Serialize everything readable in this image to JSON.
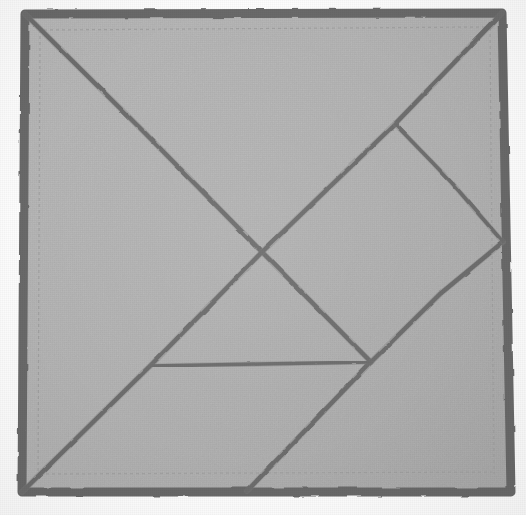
{
  "scene": {
    "title": "Tangram dissection square on cloth",
    "medium": "hand-drawn lines on gray fabric",
    "canvas": {
      "width": 526,
      "height": 515
    },
    "page_background": "#fefefe"
  },
  "colors": {
    "cloth_fill": "#b2b2b2",
    "cloth_fill_light": "#b8b8b8",
    "cloth_fill_dark": "#aaaaaa",
    "border_stroke": "#6b6b6b",
    "line_stroke": "#6e6e6e",
    "line_stroke_soft": "#7e7e7e",
    "hem_stitch": "#a2a2a2"
  },
  "strokes": {
    "border_width": 9,
    "line_width": 4.2,
    "line_width_thin": 3.2,
    "hem_width": 1.2
  },
  "cloth_outline": {
    "name": "square-cloth-outline",
    "points": "25,14 502,13 511,492 22,492"
  },
  "hem_stitching": [
    {
      "name": "hem-top",
      "points": "44,30 486,27"
    },
    {
      "name": "hem-bottom",
      "points": "40,474 492,472"
    },
    {
      "name": "hem-left",
      "points": "40,30 38,474"
    },
    {
      "name": "hem-right",
      "points": "490,28 494,474"
    }
  ],
  "dissection_lines": [
    {
      "id": "main-diagonal",
      "label": "Top-left corner to lower mid vertex",
      "points": "25,14 143,131 262,252 371,362",
      "width": 4.4
    },
    {
      "id": "anti-diagonal",
      "label": "Bottom-left corner to top-right corner",
      "points": "22,492 150,366 262,252 395,124 502,13",
      "width": 4.4
    },
    {
      "id": "bottom-diagonal",
      "label": "Bottom edge to right edge through mid vertex",
      "points": "247,491 371,362 440,294 503,242",
      "width": 4.4
    },
    {
      "id": "horizontal-chord",
      "label": "Horizontal chord between anti-diagonal and mid vertex",
      "points": "151,366 262,364 371,362",
      "width": 3.6
    },
    {
      "id": "upper-right-chord",
      "label": "Short chord from anti-diagonal down-right to right edge",
      "points": "395,124 430,160 452,183 477,212 503,242",
      "width": 3.6
    }
  ],
  "vertices": [
    {
      "id": "corner-top-left",
      "x": 25,
      "y": 14
    },
    {
      "id": "corner-top-right",
      "x": 502,
      "y": 13
    },
    {
      "id": "corner-bottom-right",
      "x": 511,
      "y": 492
    },
    {
      "id": "corner-bottom-left",
      "x": 22,
      "y": 492
    },
    {
      "id": "center-crossing",
      "x": 262,
      "y": 252
    },
    {
      "id": "mid-lower-vertex",
      "x": 371,
      "y": 362
    },
    {
      "id": "left-chord-vertex",
      "x": 151,
      "y": 366
    },
    {
      "id": "upper-right-vertex",
      "x": 395,
      "y": 124
    },
    {
      "id": "right-edge-vertex",
      "x": 503,
      "y": 242
    },
    {
      "id": "bottom-edge-vertex",
      "x": 247,
      "y": 491
    }
  ],
  "pieces": [
    {
      "id": "piece-large-triangle-upper-left",
      "name": "large triangle (upper left)"
    },
    {
      "id": "piece-large-triangle-lower-left",
      "name": "large triangle (lower left)"
    },
    {
      "id": "piece-medium-triangle-bottom",
      "name": "medium triangle (bottom)"
    },
    {
      "id": "piece-small-triangle-upper-right",
      "name": "small triangle (upper right)"
    },
    {
      "id": "piece-small-triangle-right",
      "name": "small triangle (right)"
    },
    {
      "id": "piece-square-center-right",
      "name": "square (center right)"
    },
    {
      "id": "piece-parallelogram-right",
      "name": "parallelogram (right)"
    }
  ]
}
